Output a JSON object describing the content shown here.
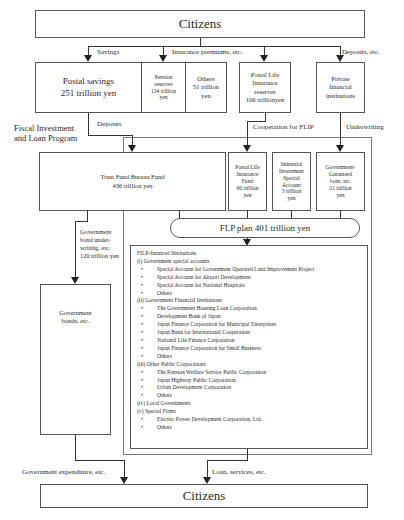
{
  "top_citizens": "Citizens",
  "bottom_citizens": "Citizens",
  "flow_labels": {
    "savings": "Savings",
    "insurance_premiums": "Insurance premiums, etc.",
    "deposits_etc": "Deposits, etc.",
    "deposits": "Deposits",
    "cooperation": "Cooperation for FLIP",
    "underwriting": "Underwriting",
    "gov_bond_underwriting": "Government\nbond under-\nwriting, etc.\n120 trillion yen",
    "gov_expenditure": "Government expenditure, etc.",
    "loan_services": "Loan, services, etc."
  },
  "sources": {
    "postal_savings": "Postal savings\n251 trillion yen",
    "pension_reserves": "Pension\nreserves\n134 trillion\nyen",
    "others": "Others\n51 trillion\nyen",
    "postal_life_reserves": "Postal Life\nInsurance\nreserves\n106 trillionyen",
    "private_institutions": "Private\nfinancial\ninstitutions"
  },
  "program_title": "Fiscal Investment\nand Loan Program",
  "funds": {
    "trust_fund": "Trust Fund Bureau Fund\n436 trillion yen",
    "postal_life_fund": "Postal Life\nInsurance\nFund\n60 trillion\nyen",
    "industrial_investment": "Industrial\nInvestment\nSpecial\nAccount\n3 trillion\nyen",
    "gov_guaranteed": "Government-\nGuranteed\nbons, etc.\n21 trillion\nyen"
  },
  "flp_plan": "FLP plan 401 trillion yen",
  "government_bonds": "Government\nbonds, etc.",
  "filp_institutions": {
    "title": "FILP-financed Institutions",
    "groups": [
      {
        "heading": "(i) Government special accounts",
        "items": [
          "Special Account for Government Operated Land Improvement Project",
          "Special Account for Airport Development",
          "Special Account for National Hospitals",
          "Others"
        ]
      },
      {
        "heading": "(ii) Government Financial Institutions",
        "items": [
          "The Government Housing Loan Corporation",
          "Development Bank of Japan",
          "Japan Finance Corporation for Municipal Enterprises",
          "Japan Bank for International Cooperation",
          "National Life Finance Corporation",
          "Japan Finance Corporation for Small Business",
          "Others"
        ]
      },
      {
        "heading": "(iii) Other Public Corporations",
        "items": [
          "The Pension Welfare Service Public Corporation",
          "Japan Highway Public Corporation",
          "Urban Development Corporation",
          "Others"
        ]
      },
      {
        "heading": "(iv) Local Governments",
        "items": []
      },
      {
        "heading": "(v) Special Firms",
        "items": [
          "Electric Power Development Corporation, Ltd.",
          "Others"
        ]
      }
    ]
  }
}
